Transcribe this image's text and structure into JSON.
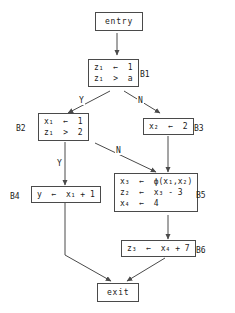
{
  "diagram": {
    "background_color": "#ffffff",
    "line_color": "#4a4a4a",
    "text_color": "#1a1a1a"
  },
  "nodes": {
    "entry": {
      "label": "entry"
    },
    "exit": {
      "label": "exit"
    },
    "b1": {
      "name": "B1",
      "statements": [
        "z₁  ←  1",
        "z₁  >  a"
      ]
    },
    "b2": {
      "name": "B2",
      "statements": [
        "x₁  ←  1",
        "z₁  >  2"
      ]
    },
    "b3": {
      "name": "B3",
      "statements": [
        "x₂  ←  2"
      ]
    },
    "b4": {
      "name": "B4",
      "statements": [
        "y  ←  x₁ + 1"
      ]
    },
    "b5": {
      "name": "B5",
      "statements": [
        "x₃  ←  ϕ(x₁,x₂)",
        "z₂  ←  x₃ - 3",
        "x₄  ←  4"
      ]
    },
    "b6": {
      "name": "B6",
      "statements": [
        "z₃  ←  x₄ + 7"
      ]
    }
  },
  "edge_labels": {
    "b1_yes": "Y",
    "b1_no": "N",
    "b2_yes": "Y",
    "b2_no": "N"
  },
  "edges": [
    {
      "from": "entry",
      "to": "B1",
      "label": ""
    },
    {
      "from": "B1",
      "to": "B2",
      "label": "Y"
    },
    {
      "from": "B1",
      "to": "B3",
      "label": "N"
    },
    {
      "from": "B2",
      "to": "B4",
      "label": "Y"
    },
    {
      "from": "B2",
      "to": "B5",
      "label": "N"
    },
    {
      "from": "B3",
      "to": "B5",
      "label": ""
    },
    {
      "from": "B5",
      "to": "B6",
      "label": ""
    },
    {
      "from": "B4",
      "to": "exit",
      "label": ""
    },
    {
      "from": "B6",
      "to": "exit",
      "label": ""
    }
  ]
}
